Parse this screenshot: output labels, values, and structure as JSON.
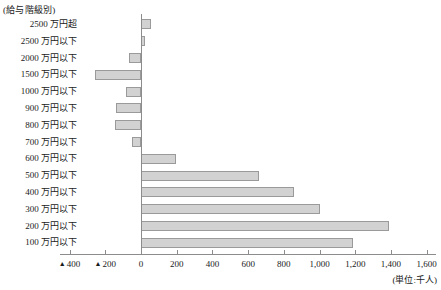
{
  "header": {
    "title": "(給与階級別)"
  },
  "axis": {
    "unit_label": "(単位:千人)",
    "negative_marker": "▲",
    "ticks": [
      {
        "value": -400,
        "label": "400",
        "negative": true
      },
      {
        "value": -200,
        "label": "200",
        "negative": true
      },
      {
        "value": 0,
        "label": "0",
        "negative": false
      },
      {
        "value": 200,
        "label": "200",
        "negative": false
      },
      {
        "value": 400,
        "label": "400",
        "negative": false
      },
      {
        "value": 600,
        "label": "600",
        "negative": false
      },
      {
        "value": 800,
        "label": "800",
        "negative": false
      },
      {
        "value": 1000,
        "label": "1,000",
        "negative": false
      },
      {
        "value": 1200,
        "label": "1,200",
        "negative": false
      },
      {
        "value": 1400,
        "label": "1,400",
        "negative": false
      },
      {
        "value": 1600,
        "label": "1,600",
        "negative": false
      }
    ]
  },
  "colors": {
    "bar_fill": "#d2d2d2",
    "bar_border": "#9a9a9a",
    "axis": "#8c8c8c",
    "text": "#1a1a1a",
    "background": "#ffffff"
  },
  "chart_data": {
    "type": "bar",
    "orientation": "horizontal",
    "title": "(給与階級別)",
    "xlabel": "(単位:千人)",
    "ylabel": "",
    "xlim": [
      -400,
      1600
    ],
    "grid": false,
    "legend": false,
    "categories": [
      "2500 万円超",
      "2500 万円以下",
      "2000 万円以下",
      "1500 万円以下",
      "1000 万円以下",
      "900 万円以下",
      "800 万円以下",
      "700 万円以下",
      "600 万円以下",
      "500 万円以下",
      "400 万円以下",
      "300 万円以下",
      "200 万円以下",
      "100 万円以下"
    ],
    "values": [
      55,
      20,
      -65,
      -258,
      -85,
      -140,
      -148,
      -50,
      195,
      660,
      855,
      1000,
      1390,
      1190
    ]
  }
}
